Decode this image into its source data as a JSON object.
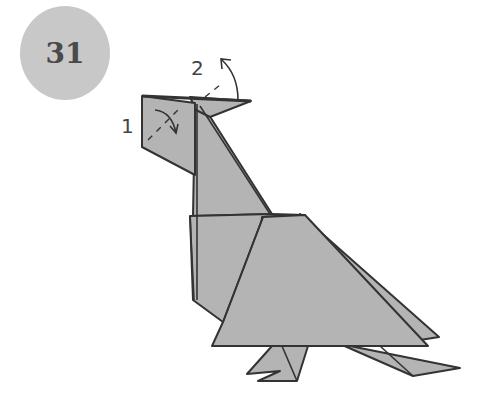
{
  "diagram": {
    "step_number": "31",
    "labels": [
      {
        "id": "1",
        "text": "1",
        "meaning": "fold head flap down (valley fold arrow)"
      },
      {
        "id": "2",
        "text": "2",
        "meaning": "fold crest flap up (arrow)"
      }
    ],
    "colors": {
      "paper": "#b4b4b4",
      "outline": "#333333",
      "badge": "#c8c8c8",
      "badge_text": "#4a4a4a"
    }
  }
}
